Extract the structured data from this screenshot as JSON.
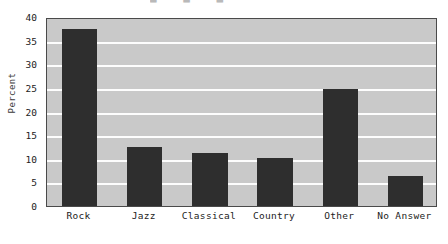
{
  "chart_data": {
    "type": "bar",
    "title": "",
    "xlabel": "",
    "ylabel": "Percent",
    "categories": [
      "Rock",
      "Jazz",
      "Classical",
      "Country",
      "Other",
      "No Answer"
    ],
    "values": [
      37.5,
      12.5,
      11.3,
      10.2,
      24.7,
      6.3
    ],
    "ylim": [
      0,
      40
    ],
    "yticks": [
      0,
      5,
      10,
      15,
      20,
      25,
      30,
      35,
      40
    ],
    "ytick_labels": [
      "0",
      "5",
      "10",
      "15",
      "20",
      "25",
      "30",
      "35",
      "40"
    ],
    "grid": "horizontal",
    "legend": "none",
    "colors": {
      "bar": "#2e2e2e",
      "plot_background": "#c9c9c9",
      "gridline": "#fdfdfd",
      "frame": "#4a4a4a",
      "page_background": "#ffffff",
      "text": "#1c1c1c"
    }
  },
  "artifact": {
    "top_strip_text": "■ ■ ■"
  }
}
